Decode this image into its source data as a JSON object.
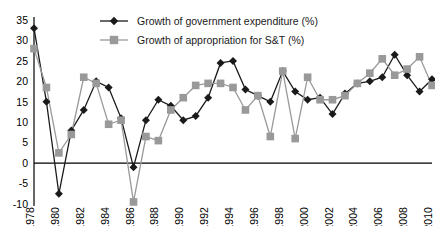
{
  "chart_data": {
    "type": "line",
    "title": "",
    "subtitle": "",
    "xlabel": "",
    "ylabel": "",
    "grid": false,
    "legend_position": "top-center",
    "ylim": [
      -10,
      35
    ],
    "yticks": [
      -10,
      -5,
      0,
      5,
      10,
      15,
      20,
      25,
      30,
      35
    ],
    "ytick_labels": [
      "-10",
      "-5",
      "0",
      "5",
      "10",
      "15",
      "20",
      "25",
      "30",
      "35"
    ],
    "xlim": [
      1978,
      2010
    ],
    "xticks": [
      1978,
      1980,
      1982,
      1984,
      1986,
      1988,
      1990,
      1992,
      1994,
      1996,
      1998,
      2000,
      2002,
      2004,
      2006,
      2008,
      2010
    ],
    "xtick_labels": [
      "1978",
      "1980",
      "1982",
      "1984",
      "1986",
      "1988",
      "1990",
      "1992",
      "1994",
      "1996",
      "1998",
      "2000",
      "2002",
      "2004",
      "2006",
      "2008",
      "2010"
    ],
    "x": [
      1978,
      1979,
      1980,
      1981,
      1982,
      1983,
      1984,
      1985,
      1986,
      1987,
      1988,
      1989,
      1990,
      1991,
      1992,
      1993,
      1994,
      1995,
      1996,
      1997,
      1998,
      1999,
      2000,
      2001,
      2002,
      2003,
      2004,
      2005,
      2006,
      2007,
      2008,
      2009,
      2010
    ],
    "series": [
      {
        "name": "Growth of government expenditure (%)",
        "color": "#1a1a1a",
        "marker": "diamond",
        "values": [
          33,
          15,
          -7.5,
          8,
          13,
          20,
          18.5,
          11,
          -1,
          10.5,
          15.5,
          14,
          10.5,
          11.5,
          16,
          24.5,
          25,
          18,
          16.5,
          15,
          22.5,
          17.5,
          15.5,
          16,
          12,
          17,
          19.5,
          20,
          21,
          26.5,
          21.5,
          17.5,
          20.5
        ]
      },
      {
        "name": "Growth of appropriation for S&T (%)",
        "color": "#999999",
        "marker": "square",
        "values": [
          28,
          18.5,
          2.5,
          7,
          21,
          19.5,
          9.5,
          10.5,
          -9.5,
          6.5,
          5.5,
          13,
          16,
          19,
          19.5,
          19.5,
          18.5,
          13,
          16.5,
          6.5,
          22.5,
          6,
          21,
          15.5,
          15.5,
          16.5,
          19.5,
          22,
          25.5,
          21.5,
          23,
          26,
          19
        ]
      }
    ]
  },
  "legend": {
    "items": [
      {
        "label": "Growth of government expenditure (%)"
      },
      {
        "label": "Growth of appropriation for S&T (%)"
      }
    ]
  }
}
